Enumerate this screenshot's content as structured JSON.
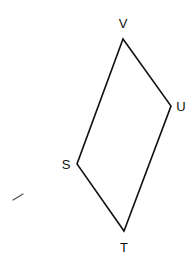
{
  "diagram": {
    "type": "quadrilateral",
    "vertices": [
      {
        "name": "V",
        "x": 123,
        "y": 39,
        "label_x": 123,
        "label_y": 28
      },
      {
        "name": "U",
        "x": 171,
        "y": 106,
        "label_x": 181,
        "label_y": 111
      },
      {
        "name": "T",
        "x": 124,
        "y": 231,
        "label_x": 124,
        "label_y": 252
      },
      {
        "name": "S",
        "x": 77,
        "y": 164,
        "label_x": 66,
        "label_y": 169
      }
    ],
    "edges": [
      [
        "V",
        "U"
      ],
      [
        "U",
        "T"
      ],
      [
        "T",
        "S"
      ],
      [
        "S",
        "V"
      ]
    ],
    "stroke_color": "#111111"
  },
  "labels": {
    "v": "V",
    "u": "U",
    "t": "T",
    "s": "S"
  }
}
